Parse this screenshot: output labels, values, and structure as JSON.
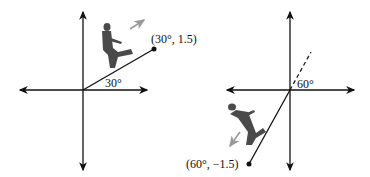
{
  "diagrams": [
    {
      "name": "left-diagram",
      "angle_label": "30°",
      "point_label": "(30°, 1.5)",
      "angle_deg": 30,
      "radius": 1.5
    },
    {
      "name": "right-diagram",
      "angle_label": "60°",
      "point_label": "(60°, −1.5)",
      "angle_deg": 60,
      "radius": -1.5
    }
  ],
  "colors": {
    "axis": "#111111",
    "figure": "#4a4a4a",
    "arrow": "#888888"
  }
}
